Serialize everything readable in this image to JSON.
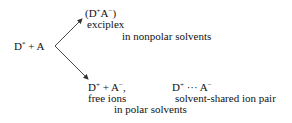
{
  "diagram": {
    "reactant": {
      "main": "D",
      "sup": "*",
      "rest": " + A"
    },
    "upper_branch": {
      "product": {
        "open": "(D",
        "sup1": "+",
        "mid": "A",
        "sup2": "−",
        "close": ")"
      },
      "label": "exciplex",
      "condition": "in nonpolar solvents"
    },
    "lower_branch": {
      "product1": {
        "a": "D",
        "sup1": "+",
        "b": " + A",
        "sup2": "−",
        "c": ","
      },
      "label1": "free ions",
      "product2": {
        "a": "D",
        "sup1": "+",
        "b": " ··· A",
        "sup2": "−"
      },
      "label2": "solvent-shared ion pair",
      "condition": "in polar solvents"
    },
    "line_color": "#333333"
  }
}
